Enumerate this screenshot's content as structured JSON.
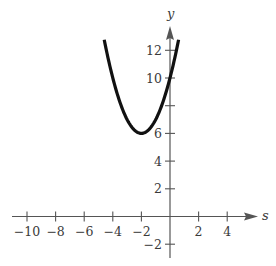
{
  "chart_data": {
    "type": "line",
    "title": "",
    "xlabel": "s",
    "ylabel": "y",
    "function": "y = (s + 2)^2 + 6",
    "vertex": [
      -2,
      6
    ],
    "y_intercept": [
      0,
      10
    ],
    "x_ticks": [
      -10,
      -8,
      -6,
      -4,
      -2,
      2,
      4
    ],
    "x_tick_labels": [
      "−10",
      "−8",
      "−6",
      "−4",
      "−2",
      "2",
      "4"
    ],
    "y_ticks": [
      -2,
      2,
      4,
      6,
      8,
      10,
      12
    ],
    "y_tick_labels": [
      "−2",
      "2",
      "4",
      "6",
      "",
      "10",
      "12"
    ],
    "xlim": [
      -11,
      6
    ],
    "ylim": [
      -3,
      13.5
    ],
    "grid": false,
    "legend": null,
    "series": [
      {
        "name": "parabola",
        "x": [
          -4.6,
          -4,
          -3.5,
          -3,
          -2.5,
          -2,
          -1.5,
          -1,
          -0.5,
          0,
          0.6
        ],
        "y": [
          12.76,
          10,
          8.25,
          7,
          6.25,
          6,
          6.25,
          7,
          8.25,
          10,
          12.76
        ]
      }
    ]
  },
  "colors": {
    "axis": "#555555",
    "curve": "#111111",
    "text": "#3a3a3a"
  }
}
